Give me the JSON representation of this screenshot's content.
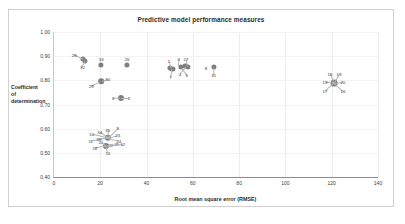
{
  "chart": {
    "title": "Predictive model performance measures",
    "xlabel": "Root mean square error (RMSE)",
    "ylabel_lines": [
      "Coefficient",
      "of",
      "determination"
    ],
    "ylabel": "Coefficient of determination",
    "marker_color": "#7f7f7f",
    "frame_color": "#d0d0d0"
  },
  "chart_data": {
    "type": "scatter",
    "title": "Predictive model performance measures",
    "xlabel": "Root mean square error (RMSE)",
    "ylabel": "Coefficient of determination",
    "xlim": [
      0,
      140
    ],
    "ylim": [
      0.4,
      1.0
    ],
    "xticks": [
      0,
      20,
      40,
      60,
      80,
      100,
      120,
      140
    ],
    "yticks": [
      "0.40",
      "0.50",
      "0.60",
      "0.70",
      "0.80",
      "0.90",
      "1.00"
    ],
    "grid": true,
    "legend": "none",
    "series": [
      {
        "name": "models",
        "points": [
          {
            "label": "28",
            "x": 12.6,
            "y": 0.887,
            "lbl_dx": -9,
            "lbl_dy": -4
          },
          {
            "label": "32",
            "x": 13.6,
            "y": 0.879,
            "lbl_dx": -3,
            "lbl_dy": 6
          },
          {
            "label": "33",
            "x": 20.4,
            "y": 0.865,
            "lbl_dx": 0,
            "lbl_dy": -6
          },
          {
            "label": "26",
            "x": 31.5,
            "y": 0.864,
            "lbl_dx": 0,
            "lbl_dy": -6
          },
          {
            "label": "27",
            "x": 57.5,
            "y": 0.861,
            "lbl_dx": -1,
            "lbl_dy": -7
          },
          {
            "label": "4",
            "x": 57.0,
            "y": 0.855,
            "lbl_dx": -6,
            "lbl_dy": 7
          },
          {
            "label": "8",
            "x": 63.5,
            "y": 0.853,
            "lbl_dx": 5,
            "lbl_dy": 0
          },
          {
            "label": "1",
            "x": 50.4,
            "y": 0.852,
            "lbl_dx": -2,
            "lbl_dy": -7
          },
          {
            "label": "3",
            "x": 53.4,
            "y": 0.858,
            "lbl_dx": 1,
            "lbl_dy": -7
          },
          {
            "label": "7",
            "x": 50.8,
            "y": 0.846,
            "lbl_dx": -1,
            "lbl_dy": 8
          },
          {
            "label": "5",
            "x": 55.2,
            "y": 0.85,
            "lbl_dx": 5,
            "lbl_dy": 7
          },
          {
            "label": "31",
            "x": 69.0,
            "y": 0.852,
            "lbl_dx": 0,
            "lbl_dy": 7
          },
          {
            "label": "29",
            "x": 20.0,
            "y": 0.795,
            "lbl_dx": -9,
            "lbl_dy": 4
          },
          {
            "label": "30",
            "x": 20.6,
            "y": 0.797,
            "lbl_dx": 6,
            "lbl_dy": -2
          },
          {
            "label": "6",
            "x": 28.6,
            "y": 0.727,
            "lbl_dx": -7,
            "lbl_dy": 0
          },
          {
            "label": "2",
            "x": 28.9,
            "y": 0.727,
            "lbl_dx": 8,
            "lbl_dy": 0
          },
          {
            "label": "9",
            "x": 23.2,
            "y": 0.562,
            "lbl_dx": 10,
            "lbl_dy": -10
          },
          {
            "label": "35",
            "x": 23.2,
            "y": 0.562,
            "lbl_dx": 0,
            "lbl_dy": -8
          },
          {
            "label": "23",
            "x": 23.2,
            "y": 0.562,
            "lbl_dx": 10,
            "lbl_dy": -3
          },
          {
            "label": "34",
            "x": 23.2,
            "y": 0.562,
            "lbl_dx": -8,
            "lbl_dy": -6
          },
          {
            "label": "10",
            "x": 23.2,
            "y": 0.562,
            "lbl_dx": -16,
            "lbl_dy": -4
          },
          {
            "label": "24",
            "x": 23.2,
            "y": 0.562,
            "lbl_dx": 11,
            "lbl_dy": 3
          },
          {
            "label": "11",
            "x": 23.2,
            "y": 0.562,
            "lbl_dx": -17,
            "lbl_dy": 3
          },
          {
            "label": "36",
            "x": 23.2,
            "y": 0.562,
            "lbl_dx": -9,
            "lbl_dy": 1
          },
          {
            "label": "21",
            "x": 22.4,
            "y": 0.527,
            "lbl_dx": -5,
            "lbl_dy": -4
          },
          {
            "label": "22",
            "x": 22.4,
            "y": 0.527,
            "lbl_dx": 5,
            "lbl_dy": -1
          },
          {
            "label": "25",
            "x": 22.4,
            "y": 0.527,
            "lbl_dx": 11,
            "lbl_dy": -2
          },
          {
            "label": "12",
            "x": 22.4,
            "y": 0.527,
            "lbl_dx": 17,
            "lbl_dy": -2
          },
          {
            "label": "18",
            "x": 22.4,
            "y": 0.527,
            "lbl_dx": -11,
            "lbl_dy": 2
          },
          {
            "label": "14",
            "x": 22.4,
            "y": 0.527,
            "lbl_dx": 2,
            "lbl_dy": 7
          },
          {
            "label": "15",
            "x": 121.0,
            "y": 0.79,
            "lbl_dx": -4,
            "lbl_dy": -9
          },
          {
            "label": "19",
            "x": 121.0,
            "y": 0.79,
            "lbl_dx": 5,
            "lbl_dy": -9
          },
          {
            "label": "13",
            "x": 121.0,
            "y": 0.79,
            "lbl_dx": -9,
            "lbl_dy": -1
          },
          {
            "label": "20",
            "x": 121.0,
            "y": 0.79,
            "lbl_dx": 9,
            "lbl_dy": -1
          },
          {
            "label": "17",
            "x": 121.0,
            "y": 0.79,
            "lbl_dx": -9,
            "lbl_dy": 8
          },
          {
            "label": "16",
            "x": 121.0,
            "y": 0.79,
            "lbl_dx": 9,
            "lbl_dy": 8
          }
        ]
      }
    ],
    "markers": [
      {
        "x": 12.6,
        "y": 0.887,
        "r": 2.6
      },
      {
        "x": 13.4,
        "y": 0.882,
        "r": 2.6
      },
      {
        "x": 20.4,
        "y": 0.865,
        "r": 2.6
      },
      {
        "x": 31.5,
        "y": 0.864,
        "r": 2.6
      },
      {
        "x": 56.8,
        "y": 0.861,
        "r": 2.6
      },
      {
        "x": 57.8,
        "y": 0.857,
        "r": 2.6
      },
      {
        "x": 50.2,
        "y": 0.851,
        "r": 2.6
      },
      {
        "x": 51.2,
        "y": 0.848,
        "r": 2.6
      },
      {
        "x": 54.8,
        "y": 0.856,
        "r": 2.6
      },
      {
        "x": 69.0,
        "y": 0.855,
        "r": 2.6
      },
      {
        "x": 20.3,
        "y": 0.796,
        "r": 2.8
      },
      {
        "x": 28.8,
        "y": 0.727,
        "r": 3.0
      },
      {
        "x": 23.2,
        "y": 0.562,
        "r": 3.2
      },
      {
        "x": 22.4,
        "y": 0.527,
        "r": 3.0
      },
      {
        "x": 121.0,
        "y": 0.79,
        "r": 3.4
      }
    ]
  }
}
